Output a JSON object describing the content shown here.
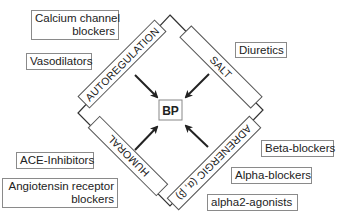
{
  "center": {
    "label": "BP"
  },
  "mechanisms": {
    "top_left": "AUTOREGULATION",
    "top_right": "SALT",
    "bottom_left": "HUMORAL",
    "bottom_right": "ADRENERGIC (α, β)"
  },
  "drugs": {
    "calcium_channel_blockers_line1": "Calcium channel",
    "calcium_channel_blockers_line2": "blockers",
    "vasodilators": "Vasodilators",
    "diuretics": "Diuretics",
    "ace_inhibitors": "ACE-Inhibitors",
    "arb_line1": "Angiotensin receptor",
    "arb_line2": "blockers",
    "beta_blockers": "Beta-blockers",
    "alpha_blockers": "Alpha-blockers",
    "alpha2_agonists": "alpha2-agonists"
  },
  "colors": {
    "line": "#333333",
    "box_border": "#8a8a8a"
  }
}
